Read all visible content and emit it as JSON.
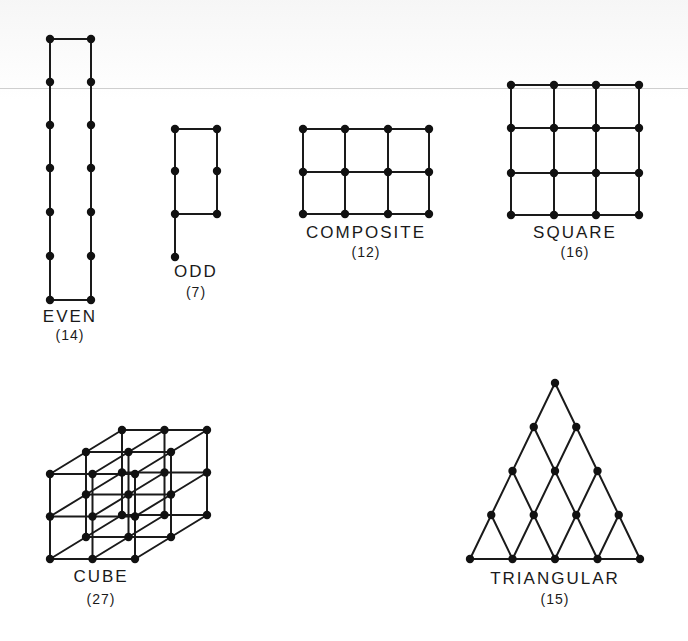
{
  "figure": {
    "colors": {
      "ink": "#1a1a1a",
      "dot": "#111111",
      "background": "#ffffff"
    },
    "panels": [
      {
        "id": "even",
        "name": "EVEN",
        "count": "(14)",
        "label_pos": [
          70,
          316
        ],
        "count_pos": [
          70,
          336
        ]
      },
      {
        "id": "odd",
        "name": "ODD",
        "count": "(7)",
        "label_pos": [
          196,
          271
        ],
        "count_pos": [
          196,
          293
        ]
      },
      {
        "id": "composite",
        "name": "COMPOSITE",
        "count": "(12)",
        "label_pos": [
          366,
          232
        ],
        "count_pos": [
          366,
          253
        ]
      },
      {
        "id": "square",
        "name": "SQUARE",
        "count": "(16)",
        "label_pos": [
          575,
          232
        ],
        "count_pos": [
          575,
          253
        ]
      },
      {
        "id": "cube",
        "name": "CUBE",
        "count": "(27)",
        "label_pos": [
          101,
          576
        ],
        "count_pos": [
          101,
          600
        ]
      },
      {
        "id": "triangular",
        "name": "TRIANGULAR",
        "count": "(15)",
        "label_pos": [
          555,
          578
        ],
        "count_pos": [
          555,
          600
        ]
      }
    ],
    "shapes": {
      "even": {
        "type": "rect_ring",
        "cols": [
          50,
          91
        ],
        "rows": [
          39,
          82,
          125,
          168,
          212,
          256,
          300
        ]
      },
      "odd": {
        "type": "rect_ring_tail",
        "cols": [
          175,
          217
        ],
        "rows": [
          129,
          171,
          214
        ],
        "tail": [
          175,
          257
        ]
      },
      "composite": {
        "type": "grid",
        "cols": [
          303,
          345,
          388,
          429
        ],
        "rows": [
          129,
          172,
          214
        ]
      },
      "square": {
        "type": "grid",
        "cols": [
          511,
          554,
          596,
          639
        ],
        "rows": [
          85,
          128,
          173,
          215
        ]
      },
      "cube": {
        "type": "cube",
        "origin": [
          50,
          559
        ],
        "step": 42.5,
        "depth": [
          36,
          -22
        ],
        "n": 3
      },
      "triangular": {
        "type": "triangle",
        "apex": [
          555,
          383
        ],
        "row_height": 44,
        "half_step": 21.25,
        "n": 5
      }
    }
  }
}
